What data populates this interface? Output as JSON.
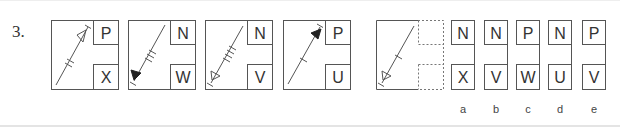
{
  "question": {
    "number": "3."
  },
  "sequence": [
    {
      "top": "P",
      "bottom": "X",
      "arrow": "outline-up-right",
      "ticks": 2
    },
    {
      "top": "N",
      "bottom": "W",
      "arrow": "filled-down-left",
      "ticks": 3
    },
    {
      "top": "N",
      "bottom": "V",
      "arrow": "outline-down-left",
      "ticks": 4
    },
    {
      "top": "P",
      "bottom": "U",
      "arrow": "filled-up-right",
      "ticks": 1
    },
    {
      "top": "?",
      "bottom": "?",
      "arrow": "outline-down-left",
      "ticks": 1
    }
  ],
  "options": [
    {
      "label": "a",
      "top": "N",
      "bottom": "X"
    },
    {
      "label": "b",
      "top": "N",
      "bottom": "V"
    },
    {
      "label": "c",
      "top": "P",
      "bottom": "W"
    },
    {
      "label": "d",
      "top": "N",
      "bottom": "U"
    },
    {
      "label": "e",
      "top": "P",
      "bottom": "V"
    }
  ],
  "colors": {
    "stroke": "#555555",
    "text": "#333333"
  }
}
